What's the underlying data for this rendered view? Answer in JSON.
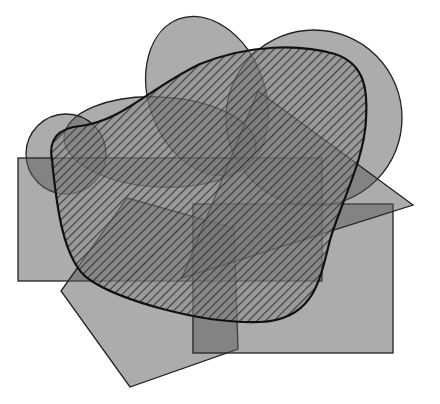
{
  "diagram": {
    "background": "#ffffff",
    "fill_color": "#5a5a5a",
    "fill_opacity": 0.5,
    "stroke_color": "#222222",
    "hatch_color": "#2a2a2a",
    "shapes": [
      {
        "id": "top-ellipse",
        "type": "ellipse",
        "cx": 207,
        "cy": 96,
        "rx": 58,
        "ry": 82,
        "rotate": -20,
        "hatched": false
      },
      {
        "id": "right-circle",
        "type": "circle",
        "cx": 314,
        "cy": 118,
        "r": 88,
        "hatched": false
      },
      {
        "id": "wide-ellipse",
        "type": "ellipse",
        "cx": 160,
        "cy": 142,
        "rx": 96,
        "ry": 45,
        "rotate": 3,
        "hatched": false
      },
      {
        "id": "small-circle",
        "type": "circle",
        "cx": 66,
        "cy": 154,
        "r": 40,
        "hatched": false
      },
      {
        "id": "left-rectangle",
        "type": "rect",
        "x": 18,
        "y": 158,
        "width": 304,
        "height": 123,
        "hatched": false
      },
      {
        "id": "pentagon",
        "type": "polygon",
        "points": "127,198 234,228 238,349 130,387 61,291",
        "hatched": false
      },
      {
        "id": "right-rectangle",
        "type": "rect",
        "x": 193,
        "y": 204,
        "width": 200,
        "height": 149,
        "hatched": false
      },
      {
        "id": "triangle",
        "type": "polygon",
        "points": "258,91 413,205 182,278",
        "hatched": false
      },
      {
        "id": "blob",
        "type": "path",
        "d": "M 52,160 C 48,140 58,128 80,126 C 120,122 150,88 200,64 C 250,44 300,44 335,54 C 365,64 368,90 366,120 C 364,160 342,200 330,240 C 320,280 314,320 260,322 C 200,324 120,300 90,280 C 62,262 56,200 52,160 Z",
        "hatched": true,
        "stroke_width": 2.2
      }
    ]
  }
}
